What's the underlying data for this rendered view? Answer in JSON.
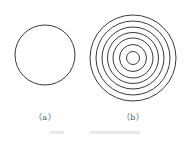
{
  "figure": {
    "stroke_color": "#3a3a3a",
    "panel_a": {
      "label": "（a）",
      "circle": {
        "cx": 45,
        "cy": 55,
        "r": 30
      }
    },
    "panel_b": {
      "label": "（b）",
      "center": {
        "cx": 133,
        "cy": 58
      },
      "ring_radii": [
        43,
        37,
        31,
        25.5,
        20,
        13.5,
        6.5
      ]
    },
    "caption": ""
  }
}
